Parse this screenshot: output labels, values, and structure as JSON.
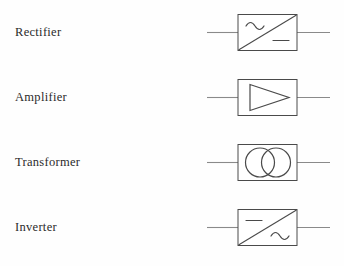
{
  "page": {
    "background_color": "#ffffff",
    "line_color": "#4a4a4a",
    "lead_color": "#8a8a8a",
    "text_color": "#2b2b2b"
  },
  "rows": [
    {
      "label": "Rectifier",
      "symbol_name": "rectifier-symbol",
      "description": "box with diagonal line, AC sine wave top-left, DC dash bottom-right",
      "input_type": "AC",
      "output_type": "DC",
      "glyph_top_left": "sine",
      "glyph_bottom_right": "dash",
      "has_diagonal": true
    },
    {
      "label": "Amplifier",
      "symbol_name": "amplifier-symbol",
      "description": "box containing a right-pointing triangle outline",
      "input_type": "",
      "output_type": "",
      "glyph_top_left": "",
      "glyph_bottom_right": "",
      "has_diagonal": false
    },
    {
      "label": "Transformer",
      "symbol_name": "transformer-symbol",
      "description": "box containing two overlapping circles",
      "input_type": "",
      "output_type": "",
      "glyph_top_left": "",
      "glyph_bottom_right": "",
      "has_diagonal": false
    },
    {
      "label": "Inverter",
      "symbol_name": "inverter-symbol",
      "description": "box with diagonal line, DC dash top-left, AC sine wave bottom-right",
      "input_type": "DC",
      "output_type": "AC",
      "glyph_top_left": "dash",
      "glyph_bottom_right": "sine",
      "has_diagonal": true
    }
  ]
}
